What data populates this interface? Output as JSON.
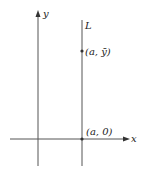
{
  "diagram": {
    "axes": {
      "x_label": "x",
      "y_label": "y"
    },
    "line": {
      "label": "L"
    },
    "points": [
      {
        "label": "(a, ȳ)"
      },
      {
        "label": "(a, 0)"
      }
    ],
    "colors": {
      "stroke": "#555555",
      "text": "#222222"
    }
  }
}
